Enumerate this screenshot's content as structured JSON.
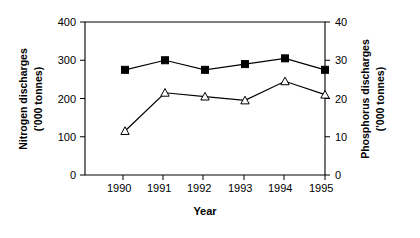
{
  "chart_data": {
    "type": "line",
    "title": "",
    "xlabel": "Year",
    "categories": [
      "1990",
      "1991",
      "1992",
      "1993",
      "1994",
      "1995"
    ],
    "grid": false,
    "legend_position": "none",
    "axes": {
      "left": {
        "label_line1": "Nitrogen discharges",
        "label_line2": "('000 tonnes)",
        "ticks": [
          "0",
          "100",
          "200",
          "300",
          "400"
        ],
        "tick_values": [
          0,
          100,
          200,
          300,
          400
        ],
        "lim": [
          0,
          400
        ]
      },
      "right": {
        "label_line1": "Phosphorus discharges",
        "label_line2": "('000 tonnes)",
        "ticks": [
          "0",
          "10",
          "20",
          "30",
          "40"
        ],
        "tick_values": [
          0,
          10,
          20,
          30,
          40
        ],
        "lim": [
          0,
          40
        ]
      },
      "x": {
        "ticks": [
          "1990",
          "1991",
          "1992",
          "1993",
          "1994",
          "1995"
        ]
      }
    },
    "series": [
      {
        "name": "Nitrogen discharges",
        "axis": "left",
        "marker": "filled-square",
        "values": [
          275,
          300,
          275,
          290,
          305,
          275
        ]
      },
      {
        "name": "Phosphorus discharges",
        "axis": "right",
        "marker": "open-triangle",
        "values": [
          11.5,
          21.5,
          20.5,
          19.5,
          24.5,
          21
        ]
      }
    ],
    "colors": {
      "line": "#000000",
      "marker_fill_series1": "#000000",
      "marker_fill_series2": "#ffffff",
      "background": "#ffffff"
    }
  }
}
